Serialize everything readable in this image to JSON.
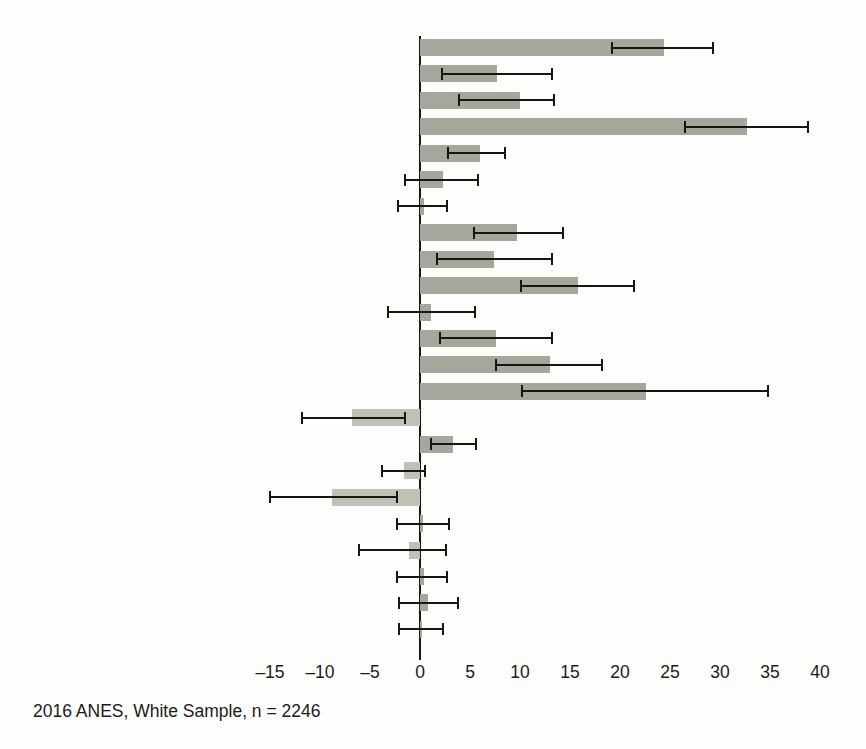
{
  "figure": {
    "caption": "2016 ANES, White Sample, n = 2246",
    "colors": {
      "bar_positive": "#a6a69c",
      "bar_negative": "#c0c0b6",
      "axis": "#17170f",
      "text": "#1b1b1b",
      "background": "#fdfdfb"
    }
  },
  "chart_data": {
    "type": "bar",
    "orientation": "horizontal",
    "title": "",
    "subtitle": "",
    "xlabel": "",
    "ylabel": "",
    "xlim": [
      -17.5,
      41.5
    ],
    "ylim": null,
    "grid": false,
    "legend": null,
    "annotations": [
      "2016 ANES, White Sample, n = 2246"
    ],
    "xticks": [
      -15,
      -10,
      -5,
      0,
      5,
      10,
      15,
      20,
      25,
      30,
      35,
      40
    ],
    "xticklabels": [
      "–15",
      "–10",
      "–5",
      "0",
      "5",
      "10",
      "15",
      "20",
      "25",
      "30",
      "35",
      "40"
    ],
    "error_bars": "95% confidence interval",
    "categories": [
      "Tea Party FT",
      "True American index",
      "Honor our Forefathers",
      "Ideology (7pt)",
      "Party ID (7pt)",
      "Worried about economy",
      "Desire small Fed Govt",
      "Attention to politics",
      "Moral traditionalism scale",
      "Racial resentment scale",
      "Authoritarianism scale",
      "Anti-egalitarianism (SDO)",
      "Sexism scale",
      "Ethnocentrism (K&K)",
      "Age",
      "Married",
      "Female",
      "Education",
      "Home owner",
      "Income",
      "Born-again Christian",
      "Church attendance",
      "Survey mode: web"
    ],
    "values": [
      24.4,
      7.7,
      10.0,
      32.7,
      6.0,
      2.3,
      0.4,
      9.7,
      7.4,
      15.8,
      1.1,
      7.6,
      13.0,
      22.6,
      -6.8,
      3.3,
      -1.6,
      -8.8,
      0.3,
      -1.1,
      0.4,
      0.8,
      0.2
    ],
    "ci_lower": [
      19.2,
      2.2,
      3.9,
      26.5,
      2.8,
      -1.5,
      -2.2,
      5.4,
      1.7,
      10.1,
      -3.2,
      2.0,
      7.6,
      10.2,
      -11.8,
      1.1,
      -3.8,
      -15.0,
      -2.3,
      -6.1,
      -2.3,
      -2.1,
      -2.1
    ],
    "ci_upper": [
      29.3,
      13.2,
      13.4,
      38.8,
      8.5,
      5.8,
      2.7,
      14.3,
      13.2,
      21.4,
      5.5,
      13.2,
      18.2,
      34.8,
      -1.5,
      5.6,
      0.5,
      -2.3,
      2.9,
      2.6,
      2.7,
      3.8,
      2.3
    ]
  }
}
